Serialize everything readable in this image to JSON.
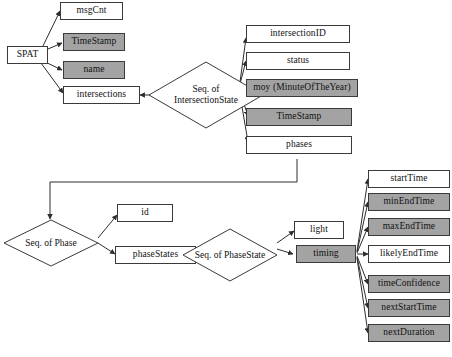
{
  "diagram": {
    "colors": {
      "shaded_fill": "#a3a3a3",
      "plain_fill": "#ffffff",
      "stroke": "#3a3a3a",
      "background": "#ffffff"
    },
    "root": {
      "label": "SPAT",
      "style": "plain"
    },
    "spat_children": [
      {
        "label": "msgCnt",
        "style": "plain"
      },
      {
        "label": "TimeStamp",
        "style": "shaded"
      },
      {
        "label": "name",
        "style": "shaded"
      },
      {
        "label": "intersections",
        "style": "plain"
      }
    ],
    "sequences": [
      {
        "label_line1": "Seq. of",
        "label_line2": "IntersectionState"
      },
      {
        "label_line1": "Seq. of Phase",
        "label_line2": ""
      },
      {
        "label_line1": "Seq. of PhaseState",
        "label_line2": ""
      }
    ],
    "intersection_state_children": [
      {
        "label": "intersectionID",
        "style": "plain"
      },
      {
        "label": "status",
        "style": "plain"
      },
      {
        "label": "moy (MinuteOfTheYear)",
        "style": "shaded"
      },
      {
        "label": "TimeStamp",
        "style": "shaded"
      },
      {
        "label": "phases",
        "style": "plain"
      }
    ],
    "phase_children": [
      {
        "label": "id",
        "style": "plain"
      },
      {
        "label": "phaseStates",
        "style": "plain"
      }
    ],
    "phase_state_children": [
      {
        "label": "light",
        "style": "plain"
      },
      {
        "label": "timing",
        "style": "shaded"
      }
    ],
    "timing_children": [
      {
        "label": "startTime",
        "style": "plain"
      },
      {
        "label": "minEndTime",
        "style": "shaded"
      },
      {
        "label": "maxEndTime",
        "style": "shaded"
      },
      {
        "label": "likelyEndTime",
        "style": "plain"
      },
      {
        "label": "timeConfidence",
        "style": "shaded"
      },
      {
        "label": "nextStartTime",
        "style": "shaded"
      },
      {
        "label": "nextDuration",
        "style": "shaded"
      }
    ]
  }
}
